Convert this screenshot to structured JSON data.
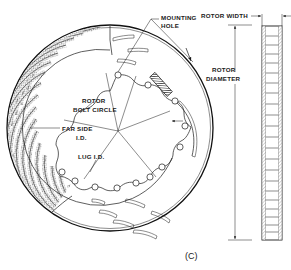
{
  "figure": {
    "caption": "(C)",
    "title_none": ""
  },
  "labels": {
    "mounting_hole_line1": "MOUNTING",
    "mounting_hole_line2": "HOLE",
    "rotor_bolt_circle_line1": "ROTOR",
    "rotor_bolt_circle_line2": "BOLT CIRCLE",
    "far_side_id_line1": "FAR SIDE",
    "far_side_id_line2": "I.D.",
    "lug_id": "LUG I.D.",
    "rotor_width": "ROTOR WIDTH",
    "rotor_diameter_line1": "ROTOR",
    "rotor_diameter_line2": "DIAMETER"
  },
  "colors": {
    "ink": "#1a1a1a",
    "paper": "#ffffff",
    "hatch": "#2b2b2b"
  },
  "geometry": {
    "face_view": {
      "outer_circle_center_x": 110,
      "outer_circle_center_y": 128,
      "outer_circle_radius": 103,
      "bolt_circle_center_x": 118,
      "bolt_circle_center_y": 131,
      "bolt_circle_radius": 56,
      "bolt_hole_count": 12,
      "far_side_id_radius": 78,
      "vane_count": 18,
      "slot_count": 8
    },
    "side_view": {
      "x_left": 262,
      "x_right": 282,
      "y_top": 26,
      "y_bottom": 240,
      "vane_rows": 22
    },
    "dimension_lines": {
      "rotor_diameter_x": 235,
      "rotor_diameter_y_top": 25,
      "rotor_diameter_y_bottom": 240,
      "rotor_width_y": 16
    }
  }
}
